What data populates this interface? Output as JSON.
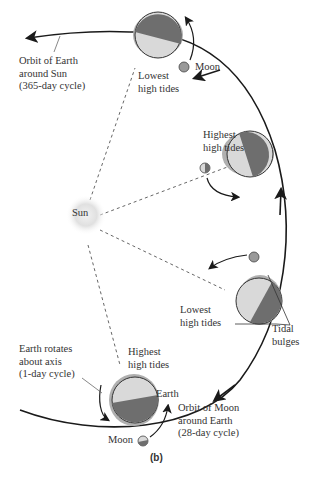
{
  "figure": {
    "panel_label": "(b)",
    "sun": {
      "label": "Sun"
    },
    "labels": {
      "earth_orbit": [
        "Orbit of Earth",
        "around Sun",
        "(365-day cycle)"
      ],
      "moon_top": "Moon",
      "lowest_top": [
        "Lowest",
        "high tides"
      ],
      "highest_right": [
        "Highest",
        "high tides"
      ],
      "lowest_bottom": [
        "Lowest",
        "high tides"
      ],
      "tidal_bulges": [
        "Tidal",
        "bulges"
      ],
      "earth_rotates": [
        "Earth rotates",
        "about axis",
        "(1-day cycle)"
      ],
      "highest_bottom": [
        "Highest",
        "high tides"
      ],
      "earth": "Earth",
      "moon_orbit": [
        "Orbit of Moon",
        "around Earth",
        "(28-day cycle)"
      ],
      "moon_bottom": "Moon"
    },
    "colors": {
      "earth_light": "#d9d9d9",
      "earth_dark": "#6e6e6e",
      "bulge": "#b0b0b0",
      "sun_glow": "#cfcfcf",
      "line": "#1a1a1a"
    }
  }
}
